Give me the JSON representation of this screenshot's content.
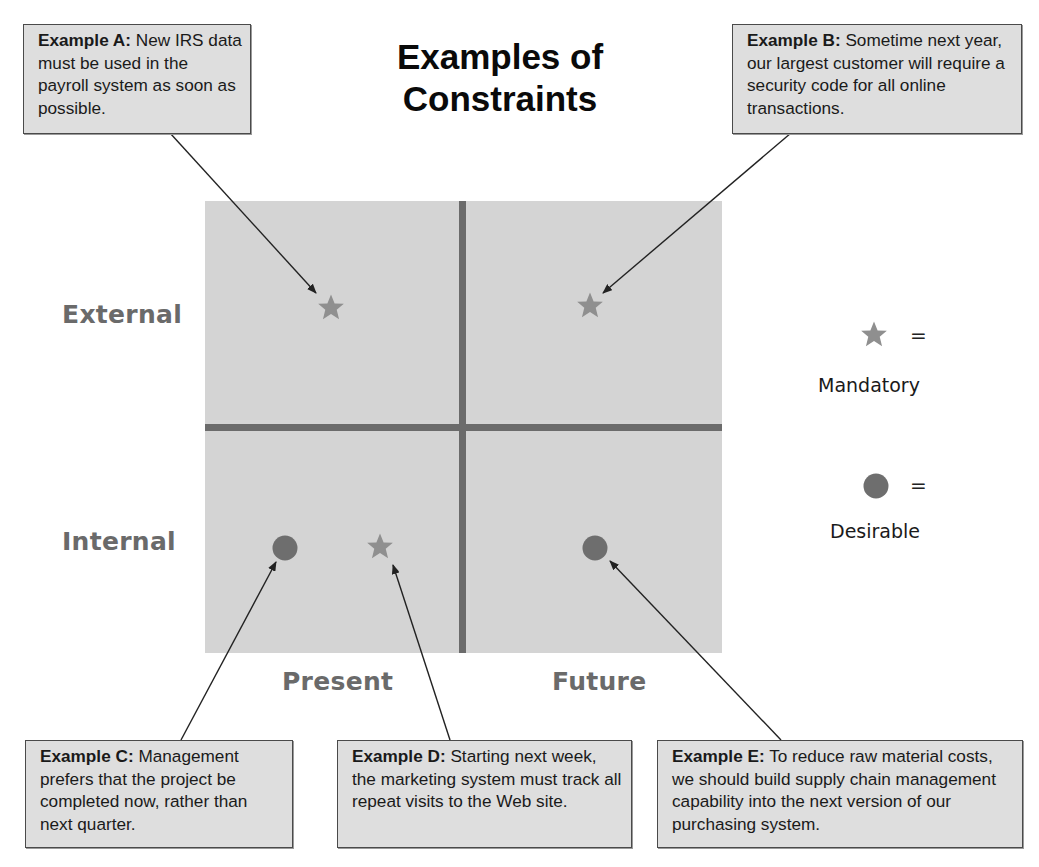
{
  "title": {
    "line1": "Examples of",
    "line2": "Constraints"
  },
  "axes": {
    "rows": [
      {
        "label": "External"
      },
      {
        "label": "Internal"
      }
    ],
    "columns": [
      {
        "label": "Present"
      },
      {
        "label": "Future"
      }
    ]
  },
  "legend": {
    "items": [
      {
        "icon": "star-icon",
        "equals": "=",
        "label": "Mandatory"
      },
      {
        "icon": "circle-icon",
        "equals": "=",
        "label": "Desirable"
      }
    ]
  },
  "examples": [
    {
      "id": "A",
      "heading": "Example A:",
      "text": "New IRS data must be used in the payroll system as soon as possible.",
      "type": "Mandatory",
      "quadrant": "External / Present"
    },
    {
      "id": "B",
      "heading": "Example B:",
      "text": "Sometime next year, our largest customer will require a security code for all online transactions.",
      "type": "Mandatory",
      "quadrant": "External / Future"
    },
    {
      "id": "C",
      "heading": "Example C:",
      "text": "Management prefers that the project be completed now, rather than next quarter.",
      "type": "Desirable",
      "quadrant": "Internal / Present"
    },
    {
      "id": "D",
      "heading": "Example D:",
      "text": "Starting next week, the marketing system must track all repeat visits to the Web site.",
      "type": "Mandatory",
      "quadrant": "Internal / Present"
    },
    {
      "id": "E",
      "heading": "Example E:",
      "text": "To reduce raw material costs, we should build supply chain management capability into the next version of our purchasing system.",
      "type": "Desirable",
      "quadrant": "Internal / Future"
    }
  ],
  "colors": {
    "grid_bg": "#d4d4d4",
    "grid_lines": "#6b6b6b",
    "star": "#8f8f8f",
    "circle": "#6e6e6e",
    "box_bg": "#dedede",
    "axis_label": "#6a6a6a"
  }
}
